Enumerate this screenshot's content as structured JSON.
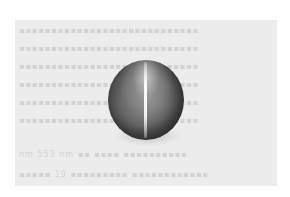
{
  "image": {
    "subject": "cat's eye gemstone (polished cabochon sphere with a single bright chatoyant band)",
    "background": "faded scanned page of printed text",
    "colors": {
      "page": "#ffffff",
      "scan_background": "#ececec",
      "gem_dark": "#262626",
      "gem_mid": "#6a6a6a",
      "gem_light": "#d2d2d2",
      "eye_band": "#ffffff",
      "faded_text": "#d2d2d2"
    }
  },
  "background_text": {
    "lines": [
      "▪▪▪▪▪▪▪▪▪▪▪▪▪▪▪▪▪▪▪▪▪▪▪▪▪▪▪▪",
      "▪▪▪▪▪▪▪▪▪▪▪▪▪▪▪▪▪▪▪▪▪▪▪▪▪▪▪▪",
      "▪▪▪▪▪▪▪▪▪▪▪▪▪▪▪▪▪▪▪▪▪▪▪▪▪▪▪▪",
      "▪▪▪▪▪▪▪▪▪▪▪▪▪▪▪▪▪▪▪▪▪▪▪▪▪▪▪▪",
      "▪▪▪▪▪▪▪▪▪▪▪▪▪▪▪▪▪▪▪▪▪▪▪▪▪▪▪▪",
      "▪▪▪▪▪▪▪▪▪▪▪▪▪▪▪▪▪▪▪▪▪▪▪▪▪▪▪▪",
      "nm  553 nm  ▪▪  ▪▪▪▪  ▪▪▪▪▪▪▪▪▪▪",
      "▪▪▪▪▪ 19 ▪▪▪▪▪▪▪▪▪ ▪▪▪▪▪▪▪▪▪▪▪▪"
    ],
    "legible_fragments": [
      "553 nm",
      "19"
    ]
  }
}
